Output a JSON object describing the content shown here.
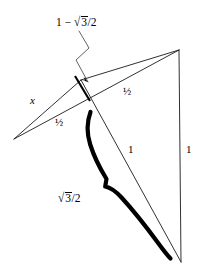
{
  "figure": {
    "width": 203,
    "height": 274,
    "background_color": "#ffffff",
    "stroke_color": "#1a1a1a",
    "labels": {
      "top_annotation_prefix": "1 − ",
      "top_annotation_radicand": "3",
      "top_annotation_suffix": "/2",
      "top_annotation_full": "1 − √3/2",
      "side_x": "x",
      "half_left": "½",
      "half_right": "½",
      "one_middle": "1",
      "one_right": "1",
      "brace_radicand": "3",
      "brace_suffix": "/2",
      "brace_label_full": "√3/2"
    },
    "vertices": {
      "left": {
        "x": 14,
        "y": 139
      },
      "apex": {
        "x": 81,
        "y": 80
      },
      "top_right": {
        "x": 179,
        "y": 50
      },
      "bottom_right": {
        "x": 181,
        "y": 262
      }
    },
    "segments": [
      {
        "name": "left-to-apex",
        "label": "x",
        "from": "left",
        "to": "apex"
      },
      {
        "name": "left-to-top-right",
        "label": "½",
        "from": "left",
        "to": "top_right"
      },
      {
        "name": "apex-to-top-right",
        "label": "½",
        "from": "apex",
        "to": "top_right"
      },
      {
        "name": "apex-to-bottom-right",
        "label": "1",
        "from": "apex",
        "to": "bottom_right"
      },
      {
        "name": "top-right-to-bottom-right",
        "label": "1",
        "from": "top_right",
        "to": "bottom_right"
      }
    ],
    "tick_mark": {
      "name": "perpendicular-tick",
      "measures": "1 − √3/2"
    },
    "brace": {
      "name": "measurement-brace",
      "measures": "√3/2"
    }
  }
}
